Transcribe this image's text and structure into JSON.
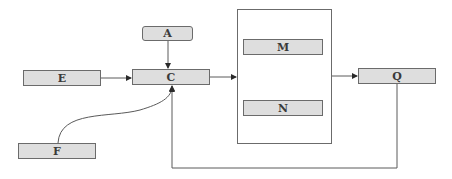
{
  "diagram": {
    "type": "block-flow",
    "nodes": {
      "A": {
        "label": "A"
      },
      "C": {
        "label": "C"
      },
      "E": {
        "label": "E"
      },
      "F": {
        "label": "F"
      },
      "M": {
        "label": "M"
      },
      "N": {
        "label": "N"
      },
      "Q": {
        "label": "Q"
      }
    },
    "groups": [
      {
        "id": "group-MN",
        "contains": [
          "M",
          "N"
        ]
      }
    ],
    "edges": [
      {
        "from": "A",
        "to": "C",
        "style": "straight",
        "arrow": true
      },
      {
        "from": "E",
        "to": "C",
        "style": "straight",
        "arrow": true
      },
      {
        "from": "F",
        "to": "C",
        "style": "curved",
        "arrow": true
      },
      {
        "from": "C",
        "to": "group-MN",
        "style": "straight",
        "arrow": true
      },
      {
        "from": "group-MN",
        "to": "Q",
        "style": "straight",
        "arrow": true
      },
      {
        "from": "Q",
        "to": "C",
        "style": "orthogonal-feedback",
        "arrow": true
      }
    ],
    "colors": {
      "node_fill": "#dedede",
      "stroke": "#6b6b6b",
      "text": "#3a3a3a"
    }
  }
}
